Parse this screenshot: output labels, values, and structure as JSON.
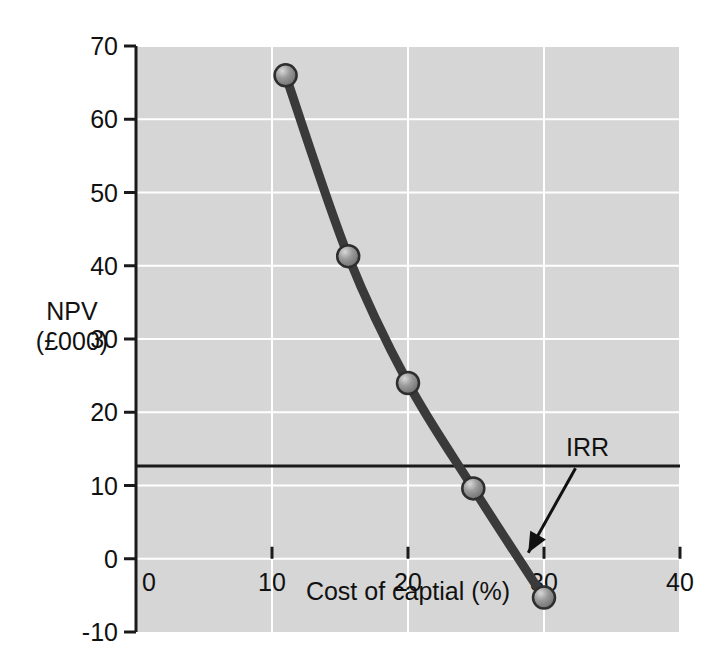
{
  "chart_data": {
    "type": "line",
    "title": "",
    "xlabel": "Cost of captial (%)",
    "ylabel": "NPV",
    "ylabel_line2": "(£000)",
    "xlim": [
      0,
      40
    ],
    "ylim": [
      -10,
      70
    ],
    "xticks": [
      0,
      10,
      20,
      30,
      40
    ],
    "xtick_labels": [
      "0",
      "10",
      "20",
      "30",
      "40"
    ],
    "yticks": [
      -10,
      0,
      10,
      20,
      30,
      40,
      50,
      60,
      70
    ],
    "ytick_labels": [
      "-10",
      "0",
      "10",
      "20",
      "30",
      "40",
      "50",
      "60",
      "70"
    ],
    "grid": true,
    "grid_color": "#ffffff",
    "plot_bg": "#d6d6d6",
    "series": [
      {
        "name": "NPV profile",
        "line_color": "#3a3a3a",
        "marker_color": "#8c8c8c",
        "x": [
          11,
          15.6,
          20,
          24.8,
          30
        ],
        "y": [
          66,
          41.3,
          24,
          9.6,
          -5.3
        ]
      }
    ],
    "annotations": [
      {
        "label": "IRR",
        "x": 28.4,
        "y": 0,
        "label_x": 33.2,
        "label_y": 14.0
      }
    ]
  },
  "axes": {
    "x_axis_name": "cost-of-capital-axis",
    "y_axis_name": "npv-axis"
  }
}
